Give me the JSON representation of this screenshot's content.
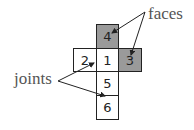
{
  "diagram": {
    "cells": [
      {
        "label": "4",
        "shaded": true
      },
      {
        "label": "2",
        "shaded": false
      },
      {
        "label": "1",
        "shaded": false
      },
      {
        "label": "3",
        "shaded": true
      },
      {
        "label": "5",
        "shaded": false
      },
      {
        "label": "6",
        "shaded": false
      }
    ],
    "annotations": {
      "faces": "faces",
      "joints": "joints"
    },
    "colors": {
      "shaded": "#9a9a9a",
      "unshaded": "#ffffff",
      "line": "#222222",
      "label_text": "#555555"
    }
  }
}
